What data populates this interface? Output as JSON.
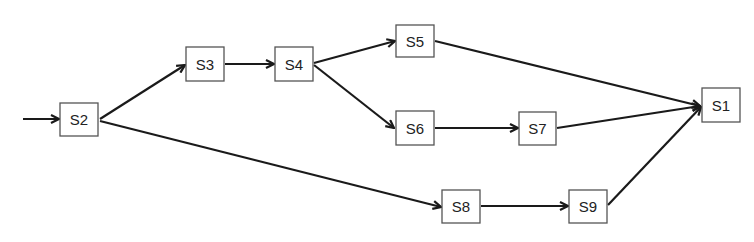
{
  "diagram": {
    "type": "directed-flow-graph",
    "colors": {
      "edge": "#1a1a1a",
      "node_border": "#555555",
      "node_fill": "#ffffff",
      "label": "#222222"
    },
    "entry": {
      "target": "S2"
    },
    "nodes": [
      {
        "id": "S1",
        "label": "S1",
        "x": 702,
        "y": 88,
        "w": 38,
        "h": 34
      },
      {
        "id": "S2",
        "label": "S2",
        "x": 60,
        "y": 103,
        "w": 38,
        "h": 33
      },
      {
        "id": "S3",
        "label": "S3",
        "x": 186,
        "y": 47,
        "w": 38,
        "h": 34
      },
      {
        "id": "S4",
        "label": "S4",
        "x": 275,
        "y": 47,
        "w": 38,
        "h": 34
      },
      {
        "id": "S5",
        "label": "S5",
        "x": 396,
        "y": 25,
        "w": 38,
        "h": 32
      },
      {
        "id": "S6",
        "label": "S6",
        "x": 396,
        "y": 111,
        "w": 38,
        "h": 34
      },
      {
        "id": "S7",
        "label": "S7",
        "x": 519,
        "y": 112,
        "w": 37,
        "h": 33
      },
      {
        "id": "S8",
        "label": "S8",
        "x": 442,
        "y": 190,
        "w": 38,
        "h": 33
      },
      {
        "id": "S9",
        "label": "S9",
        "x": 569,
        "y": 190,
        "w": 38,
        "h": 33
      }
    ],
    "edges": [
      {
        "from": "entry",
        "to": "S2"
      },
      {
        "from": "S2",
        "to": "S3"
      },
      {
        "from": "S2",
        "to": "S8"
      },
      {
        "from": "S3",
        "to": "S4"
      },
      {
        "from": "S4",
        "to": "S5"
      },
      {
        "from": "S4",
        "to": "S6"
      },
      {
        "from": "S5",
        "to": "S1"
      },
      {
        "from": "S6",
        "to": "S7"
      },
      {
        "from": "S7",
        "to": "S1"
      },
      {
        "from": "S8",
        "to": "S9"
      },
      {
        "from": "S9",
        "to": "S1"
      }
    ]
  }
}
